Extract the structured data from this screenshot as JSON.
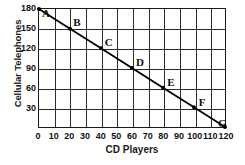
{
  "chart_data": {
    "type": "line",
    "title": "",
    "xlabel": "CD Players",
    "ylabel": "Cellular Telephones",
    "xlim": [
      0,
      120
    ],
    "ylim": [
      0,
      180
    ],
    "grid": true,
    "legend": "none",
    "xticks": [
      "0",
      "10",
      "20",
      "30",
      "40",
      "50",
      "60",
      "70",
      "80",
      "90",
      "100",
      "110",
      "120"
    ],
    "xtick_values": [
      0,
      10,
      20,
      30,
      40,
      50,
      60,
      70,
      80,
      90,
      100,
      110,
      120
    ],
    "yticks": [
      "180",
      "150",
      "120",
      "90",
      "60",
      "30"
    ],
    "ytick_values": [
      180,
      150,
      120,
      90,
      60,
      30
    ],
    "series": [
      {
        "name": "",
        "color": "#000000",
        "x": [
          0,
          20,
          40,
          60,
          80,
          100,
          120
        ],
        "y": [
          180,
          150,
          120,
          90,
          60,
          30,
          0
        ],
        "point_labels": [
          "A",
          "B",
          "C",
          "D",
          "E",
          "F",
          "G"
        ]
      }
    ],
    "points": [
      {
        "label": "A",
        "x": 0,
        "y": 180
      },
      {
        "label": "B",
        "x": 20,
        "y": 150
      },
      {
        "label": "C",
        "x": 40,
        "y": 120
      },
      {
        "label": "D",
        "x": 60,
        "y": 90
      },
      {
        "label": "E",
        "x": 80,
        "y": 60
      },
      {
        "label": "F",
        "x": 100,
        "y": 30
      },
      {
        "label": "G",
        "x": 120,
        "y": 0
      }
    ],
    "colors": {
      "line": "#000000",
      "grid": "#2b2b2b",
      "frame": "#1b1b1b",
      "text": "#111111",
      "background": "#ffffff"
    }
  }
}
